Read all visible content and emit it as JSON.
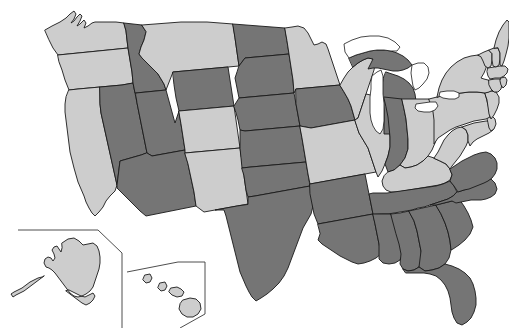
{
  "map": {
    "title": "United States Choropleth Map",
    "width": 509,
    "height": 328,
    "background_color": "#ffffff",
    "border_color": "#1a1a1a",
    "projection_note": "Albers-style USA with Alaska and Hawaii insets",
    "legend": {
      "visible": false,
      "categories": [
        {
          "key": "dark",
          "label": "Highlighted",
          "color": "#757575"
        },
        {
          "key": "light",
          "label": "Not highlighted",
          "color": "#cdcdcd"
        }
      ]
    },
    "insets": [
      {
        "name": "alaska-inset",
        "label": "Alaska"
      },
      {
        "name": "hawaii-inset",
        "label": "Hawaii"
      }
    ],
    "counts": {
      "dark": 24,
      "light": 27,
      "total": 51
    },
    "water_features": [
      "Lake Superior",
      "Lake Michigan",
      "Lake Huron",
      "Lake Erie",
      "Lake Ontario"
    ],
    "states": [
      {
        "code": "WA",
        "name": "Washington",
        "shade": "light"
      },
      {
        "code": "OR",
        "name": "Oregon",
        "shade": "light"
      },
      {
        "code": "CA",
        "name": "California",
        "shade": "light"
      },
      {
        "code": "NV",
        "name": "Nevada",
        "shade": "dark"
      },
      {
        "code": "ID",
        "name": "Idaho",
        "shade": "dark"
      },
      {
        "code": "MT",
        "name": "Montana",
        "shade": "light"
      },
      {
        "code": "WY",
        "name": "Wyoming",
        "shade": "dark"
      },
      {
        "code": "UT",
        "name": "Utah",
        "shade": "dark"
      },
      {
        "code": "AZ",
        "name": "Arizona",
        "shade": "dark"
      },
      {
        "code": "CO",
        "name": "Colorado",
        "shade": "light"
      },
      {
        "code": "NM",
        "name": "New Mexico",
        "shade": "light"
      },
      {
        "code": "ND",
        "name": "North Dakota",
        "shade": "dark"
      },
      {
        "code": "SD",
        "name": "South Dakota",
        "shade": "dark"
      },
      {
        "code": "NE",
        "name": "Nebraska",
        "shade": "dark"
      },
      {
        "code": "KS",
        "name": "Kansas",
        "shade": "dark"
      },
      {
        "code": "OK",
        "name": "Oklahoma",
        "shade": "dark"
      },
      {
        "code": "TX",
        "name": "Texas",
        "shade": "dark"
      },
      {
        "code": "MN",
        "name": "Minnesota",
        "shade": "light"
      },
      {
        "code": "IA",
        "name": "Iowa",
        "shade": "dark"
      },
      {
        "code": "MO",
        "name": "Missouri",
        "shade": "light"
      },
      {
        "code": "AR",
        "name": "Arkansas",
        "shade": "dark"
      },
      {
        "code": "LA",
        "name": "Louisiana",
        "shade": "dark"
      },
      {
        "code": "WI",
        "name": "Wisconsin",
        "shade": "light"
      },
      {
        "code": "IL",
        "name": "Illinois",
        "shade": "light"
      },
      {
        "code": "MI",
        "name": "Michigan",
        "shade": "dark"
      },
      {
        "code": "IN",
        "name": "Indiana",
        "shade": "dark"
      },
      {
        "code": "OH",
        "name": "Ohio",
        "shade": "light"
      },
      {
        "code": "KY",
        "name": "Kentucky",
        "shade": "light"
      },
      {
        "code": "TN",
        "name": "Tennessee",
        "shade": "dark"
      },
      {
        "code": "MS",
        "name": "Mississippi",
        "shade": "dark"
      },
      {
        "code": "AL",
        "name": "Alabama",
        "shade": "dark"
      },
      {
        "code": "GA",
        "name": "Georgia",
        "shade": "dark"
      },
      {
        "code": "FL",
        "name": "Florida",
        "shade": "dark"
      },
      {
        "code": "SC",
        "name": "South Carolina",
        "shade": "dark"
      },
      {
        "code": "NC",
        "name": "North Carolina",
        "shade": "dark"
      },
      {
        "code": "VA",
        "name": "Virginia",
        "shade": "dark"
      },
      {
        "code": "WV",
        "name": "West Virginia",
        "shade": "light"
      },
      {
        "code": "MD",
        "name": "Maryland",
        "shade": "light"
      },
      {
        "code": "DE",
        "name": "Delaware",
        "shade": "light"
      },
      {
        "code": "PA",
        "name": "Pennsylvania",
        "shade": "light"
      },
      {
        "code": "NJ",
        "name": "New Jersey",
        "shade": "light"
      },
      {
        "code": "NY",
        "name": "New York",
        "shade": "light"
      },
      {
        "code": "CT",
        "name": "Connecticut",
        "shade": "light"
      },
      {
        "code": "RI",
        "name": "Rhode Island",
        "shade": "light"
      },
      {
        "code": "MA",
        "name": "Massachusetts",
        "shade": "light"
      },
      {
        "code": "VT",
        "name": "Vermont",
        "shade": "light"
      },
      {
        "code": "NH",
        "name": "New Hampshire",
        "shade": "light"
      },
      {
        "code": "ME",
        "name": "Maine",
        "shade": "light"
      },
      {
        "code": "AK",
        "name": "Alaska",
        "shade": "light"
      },
      {
        "code": "HI",
        "name": "Hawaii",
        "shade": "light"
      }
    ]
  }
}
